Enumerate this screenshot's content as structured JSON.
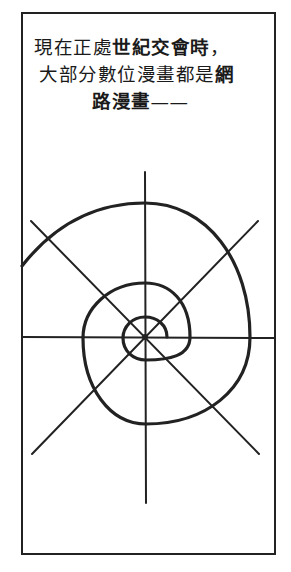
{
  "caption": {
    "line1": {
      "normal": "現在正處",
      "bold": "世紀交會時",
      "tail": "，"
    },
    "line2": {
      "normal": "大部分數位漫畫都是",
      "bold": "網"
    },
    "line3": {
      "bold": "路漫畫",
      "tail": "——"
    }
  },
  "diagram": {
    "type": "spiral-with-radial-lines",
    "radial_line_count": 8,
    "stroke_color": "#222222",
    "spiral_turns": 3
  }
}
